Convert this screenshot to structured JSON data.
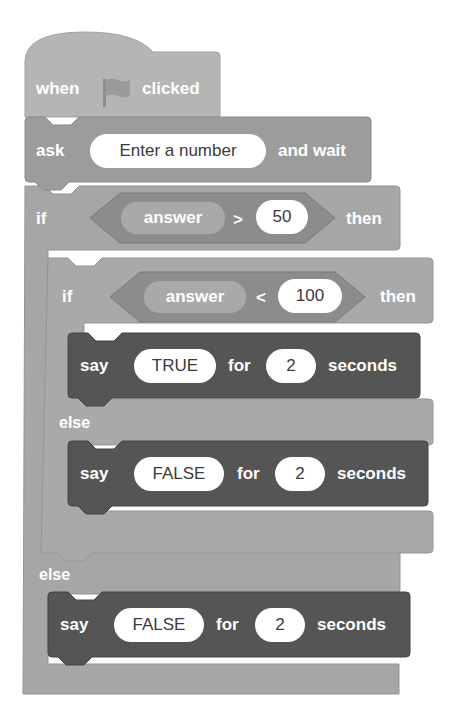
{
  "colors": {
    "event_block": "#b5b5b5",
    "sensing_block": "#9c9c9c",
    "control_block": "#a6a6a6",
    "looks_block": "#555555",
    "operator_block": "#8c8c8c",
    "input_fill": "#ffffff",
    "label_text": "#ffffff",
    "input_text": "#3b3b3b"
  },
  "script": {
    "hat": {
      "when": "when",
      "flag_icon": "green-flag",
      "clicked": "clicked"
    },
    "ask": {
      "label": "ask",
      "input": "Enter a number",
      "suffix": "and wait"
    },
    "outer_if": {
      "if_label": "if",
      "condition": {
        "reporter": "answer",
        "operator": ">",
        "value": "50"
      },
      "then_label": "then",
      "else_label": "else"
    },
    "inner_if": {
      "if_label": "if",
      "condition": {
        "reporter": "answer",
        "operator": "<",
        "value": "100"
      },
      "then_label": "then",
      "else_label": "else"
    },
    "say_true": {
      "label": "say",
      "message": "TRUE",
      "for": "for",
      "secs": "2",
      "unit": "seconds"
    },
    "say_false_inner": {
      "label": "say",
      "message": "FALSE",
      "for": "for",
      "secs": "2",
      "unit": "seconds"
    },
    "say_false_outer": {
      "label": "say",
      "message": "FALSE",
      "for": "for",
      "secs": "2",
      "unit": "seconds"
    }
  }
}
